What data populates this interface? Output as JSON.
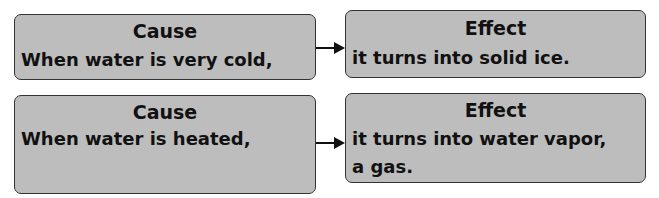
{
  "rows": [
    {
      "cause": {
        "title": "Cause",
        "lines": [
          "When water is very cold,"
        ]
      },
      "effect": {
        "title": "Effect",
        "lines": [
          "it turns into solid ice."
        ]
      }
    },
    {
      "cause": {
        "title": "Cause",
        "lines": [
          "When water is heated,"
        ]
      },
      "effect": {
        "title": "Effect",
        "lines": [
          "it turns into water vapor,",
          "a gas."
        ]
      }
    }
  ],
  "colors": {
    "box_fill": "#bdbdbd",
    "border": "#333333",
    "arrow": "#111111"
  }
}
